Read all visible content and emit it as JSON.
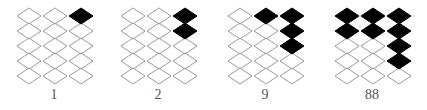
{
  "figure": {
    "rows": 5,
    "cols": 3,
    "colors": {
      "filled": "#000000",
      "outline": "#9a9a9a",
      "empty": "#ffffff",
      "label": "#555555"
    },
    "panels": [
      {
        "label": "1",
        "left": 16,
        "filled": [
          [
            0,
            2
          ]
        ]
      },
      {
        "label": "2",
        "left": 120,
        "filled": [
          [
            0,
            2
          ],
          [
            1,
            2
          ]
        ]
      },
      {
        "label": "9",
        "left": 227,
        "filled": [
          [
            0,
            1
          ],
          [
            0,
            2
          ],
          [
            1,
            2
          ],
          [
            2,
            2
          ]
        ]
      },
      {
        "label": "88",
        "left": 334,
        "filled": [
          [
            0,
            0
          ],
          [
            1,
            0
          ],
          [
            0,
            1
          ],
          [
            1,
            1
          ],
          [
            0,
            2
          ],
          [
            1,
            2
          ],
          [
            2,
            2
          ],
          [
            3,
            2
          ]
        ]
      }
    ]
  }
}
